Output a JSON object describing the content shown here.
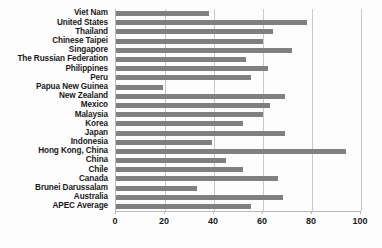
{
  "chart_data": {
    "type": "bar",
    "orientation": "horizontal",
    "title": "",
    "subtitle": "",
    "xlabel": "",
    "ylabel": "",
    "xlim": [
      0,
      100
    ],
    "xticks": [
      0,
      20,
      40,
      60,
      80,
      100
    ],
    "xtick_labels": [
      "0",
      "20",
      "40",
      "60",
      "80",
      "100"
    ],
    "grid": true,
    "legend": false,
    "bar_color": "#808080",
    "background_color": "#fdfdfd",
    "gridline_color": "#c9c9c9",
    "axis_color": "#b8b8b8",
    "categories": [
      "Viet Nam",
      "United States",
      "Thailand",
      "Chinese Taipei",
      "Singapore",
      "The Russian Federation",
      "Philippines",
      "Peru",
      "Papua New Guinea",
      "New Zealand",
      "Mexico",
      "Malaysia",
      "Korea",
      "Japan",
      "Indonesia",
      "Hong Kong, China",
      "China",
      "Chile",
      "Canada",
      "Brunei Darussalam",
      "Australia",
      "APEC Average"
    ],
    "values": [
      38,
      78,
      64,
      60,
      72,
      53,
      62,
      55,
      19,
      69,
      63,
      60,
      52,
      69,
      39,
      94,
      45,
      52,
      66,
      33,
      68,
      55
    ]
  }
}
